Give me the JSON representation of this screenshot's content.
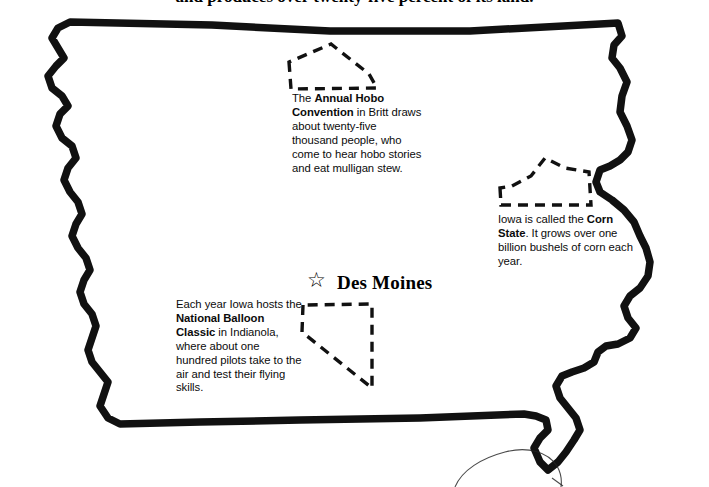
{
  "page": {
    "title_partial": "and produces over twenty-five percent of its land.",
    "background_color": "#ffffff",
    "ink_color": "#000000"
  },
  "map": {
    "state_name": "Iowa",
    "outline_style": "thick hand-drawn black outline",
    "capital": {
      "marker_icon": "star-outline",
      "marker_glyph": "☆",
      "label": "Des Moines"
    },
    "county_outlines": [
      {
        "name": "hancock-county",
        "style": "dashed"
      },
      {
        "name": "corn-region",
        "style": "dashed"
      },
      {
        "name": "warren-county",
        "style": "dashed"
      }
    ],
    "neighbor_fragment": "partial thin outline of adjoining state at bottom right"
  },
  "notes": {
    "hobo": {
      "lead": "The ",
      "bold1": "Annual Hobo",
      "bold2": "Convention",
      "rest": " in Britt draws about twenty-five thousand people, who come to hear hobo stories and eat mulligan stew."
    },
    "corn": {
      "lead": "Iowa is called the ",
      "bold1": "Corn",
      "bold2": "State",
      "rest": ". It grows over one billion bushels of corn each year."
    },
    "balloon": {
      "lead": "Each year Iowa hosts the ",
      "bold1": "National Balloon",
      "bold2": "Classic",
      "rest": " in Indianola, where about one hundred pilots take to the air and test their flying skills."
    }
  }
}
